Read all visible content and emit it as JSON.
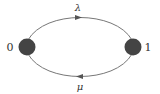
{
  "diagram": {
    "type": "two-state-markov-chain",
    "colors": {
      "node": "#444444",
      "edge": "#777777",
      "text": "#333333"
    },
    "nodes": [
      {
        "id": "0",
        "label": "0"
      },
      {
        "id": "1",
        "label": "1"
      }
    ],
    "edges": [
      {
        "from": "0",
        "to": "1",
        "label": "λ"
      },
      {
        "from": "1",
        "to": "0",
        "label": "μ"
      }
    ]
  }
}
